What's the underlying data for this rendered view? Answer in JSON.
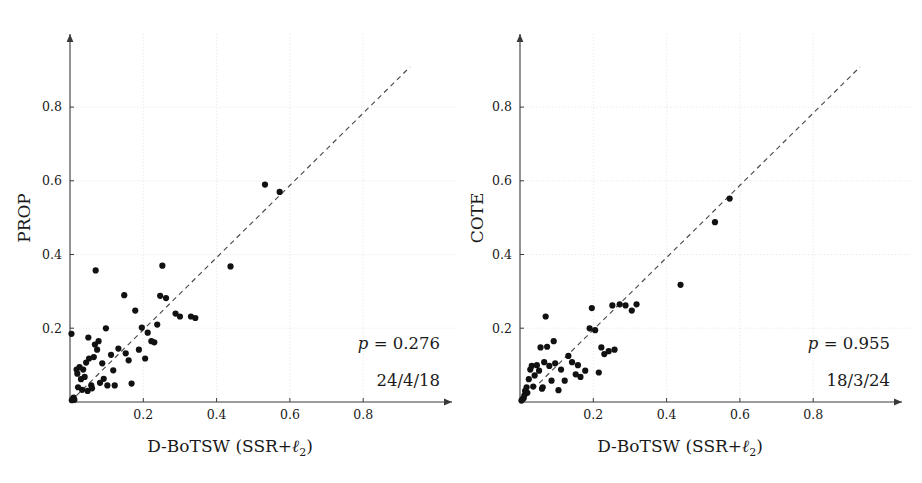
{
  "figure": {
    "width": 922,
    "height": 483,
    "background": "#ffffff",
    "dot_color": "#111111",
    "axis_color": "#3a3a3a",
    "grid_color": "#d8d8d8",
    "diagonal_color": "#4a4a4a"
  },
  "panels": [
    {
      "id": "left",
      "ylabel": "PROP",
      "xlabel_main": "D-BoTSW (SSR+",
      "xlabel_sym": "ℓ",
      "xlabel_sub": "2",
      "xlabel_close": ")",
      "xlabel_full": "D-BoTSW (SSR+ℓ2)",
      "p_label": "p",
      "p_eq": " = ",
      "p_value": "0.276",
      "p_text": "p = 0.276",
      "win_tie_loss": "24/4/18",
      "xticks": [
        "0.2",
        "0.4",
        "0.6",
        "0.8"
      ],
      "yticks": [
        "0.2",
        "0.4",
        "0.6",
        "0.8"
      ]
    },
    {
      "id": "right",
      "ylabel": "COTE",
      "xlabel_main": "D-BoTSW (SSR+",
      "xlabel_sym": "ℓ",
      "xlabel_sub": "2",
      "xlabel_close": ")",
      "xlabel_full": "D-BoTSW (SSR+ℓ2)",
      "p_label": "p",
      "p_eq": " = ",
      "p_value": "0.955",
      "p_text": "p = 0.955",
      "win_tie_loss": "18/3/24",
      "xticks": [
        "0.2",
        "0.4",
        "0.6",
        "0.8"
      ],
      "yticks": [
        "0.2",
        "0.4",
        "0.6",
        "0.8"
      ]
    }
  ],
  "chart_data": [
    {
      "type": "scatter",
      "title": "",
      "xlabel": "D-BoTSW (SSR+ℓ2)",
      "ylabel": "PROP",
      "xlim": [
        0,
        1.0
      ],
      "ylim": [
        0,
        1.0
      ],
      "xticks": [
        0.2,
        0.4,
        0.6,
        0.8
      ],
      "yticks": [
        0.2,
        0.4,
        0.6,
        0.8
      ],
      "grid": true,
      "legend": "none",
      "annotations": [
        "p = 0.276",
        "24/4/18"
      ],
      "reference_line": {
        "type": "identity",
        "style": "dashed",
        "from": [
          0.0,
          0.0
        ],
        "to": [
          0.93,
          0.96
        ]
      },
      "points": [
        [
          0.005,
          0.005
        ],
        [
          0.008,
          0.008
        ],
        [
          0.01,
          0.012
        ],
        [
          0.012,
          0.006
        ],
        [
          0.004,
          0.185
        ],
        [
          0.018,
          0.088
        ],
        [
          0.02,
          0.077
        ],
        [
          0.022,
          0.04
        ],
        [
          0.026,
          0.095
        ],
        [
          0.03,
          0.062
        ],
        [
          0.033,
          0.033
        ],
        [
          0.036,
          0.088
        ],
        [
          0.04,
          0.068
        ],
        [
          0.044,
          0.107
        ],
        [
          0.048,
          0.03
        ],
        [
          0.05,
          0.175
        ],
        [
          0.052,
          0.118
        ],
        [
          0.058,
          0.045
        ],
        [
          0.06,
          0.037
        ],
        [
          0.065,
          0.122
        ],
        [
          0.068,
          0.156
        ],
        [
          0.07,
          0.357
        ],
        [
          0.074,
          0.142
        ],
        [
          0.078,
          0.165
        ],
        [
          0.082,
          0.052
        ],
        [
          0.088,
          0.105
        ],
        [
          0.092,
          0.063
        ],
        [
          0.098,
          0.2
        ],
        [
          0.102,
          0.045
        ],
        [
          0.112,
          0.128
        ],
        [
          0.118,
          0.086
        ],
        [
          0.122,
          0.045
        ],
        [
          0.132,
          0.145
        ],
        [
          0.148,
          0.29
        ],
        [
          0.152,
          0.132
        ],
        [
          0.16,
          0.113
        ],
        [
          0.168,
          0.05
        ],
        [
          0.178,
          0.248
        ],
        [
          0.188,
          0.142
        ],
        [
          0.196,
          0.202
        ],
        [
          0.205,
          0.118
        ],
        [
          0.212,
          0.188
        ],
        [
          0.222,
          0.165
        ],
        [
          0.23,
          0.162
        ],
        [
          0.238,
          0.21
        ],
        [
          0.246,
          0.288
        ],
        [
          0.252,
          0.37
        ],
        [
          0.262,
          0.282
        ],
        [
          0.288,
          0.24
        ],
        [
          0.3,
          0.232
        ],
        [
          0.33,
          0.232
        ],
        [
          0.342,
          0.228
        ],
        [
          0.438,
          0.368
        ],
        [
          0.532,
          0.59
        ],
        [
          0.572,
          0.57
        ]
      ]
    },
    {
      "type": "scatter",
      "title": "",
      "xlabel": "D-BoTSW (SSR+ℓ2)",
      "ylabel": "COTE",
      "xlim": [
        0,
        1.0
      ],
      "ylim": [
        0,
        1.0
      ],
      "xticks": [
        0.2,
        0.4,
        0.6,
        0.8
      ],
      "yticks": [
        0.2,
        0.4,
        0.6,
        0.8
      ],
      "grid": true,
      "legend": "none",
      "annotations": [
        "p = 0.955",
        "18/3/24"
      ],
      "reference_line": {
        "type": "identity",
        "style": "dashed",
        "from": [
          0.0,
          0.0
        ],
        "to": [
          0.93,
          0.96
        ]
      },
      "points": [
        [
          0.004,
          0.004
        ],
        [
          0.007,
          0.008
        ],
        [
          0.01,
          0.01
        ],
        [
          0.012,
          0.018
        ],
        [
          0.014,
          0.03
        ],
        [
          0.018,
          0.04
        ],
        [
          0.02,
          0.025
        ],
        [
          0.024,
          0.062
        ],
        [
          0.028,
          0.088
        ],
        [
          0.032,
          0.098
        ],
        [
          0.036,
          0.042
        ],
        [
          0.04,
          0.072
        ],
        [
          0.046,
          0.1
        ],
        [
          0.052,
          0.085
        ],
        [
          0.056,
          0.148
        ],
        [
          0.06,
          0.036
        ],
        [
          0.062,
          0.04
        ],
        [
          0.066,
          0.108
        ],
        [
          0.07,
          0.232
        ],
        [
          0.074,
          0.15
        ],
        [
          0.08,
          0.098
        ],
        [
          0.086,
          0.058
        ],
        [
          0.092,
          0.165
        ],
        [
          0.096,
          0.105
        ],
        [
          0.105,
          0.032
        ],
        [
          0.112,
          0.088
        ],
        [
          0.122,
          0.058
        ],
        [
          0.132,
          0.125
        ],
        [
          0.142,
          0.108
        ],
        [
          0.152,
          0.075
        ],
        [
          0.158,
          0.1
        ],
        [
          0.165,
          0.068
        ],
        [
          0.178,
          0.085
        ],
        [
          0.19,
          0.2
        ],
        [
          0.196,
          0.255
        ],
        [
          0.205,
          0.195
        ],
        [
          0.215,
          0.08
        ],
        [
          0.222,
          0.148
        ],
        [
          0.23,
          0.13
        ],
        [
          0.242,
          0.138
        ],
        [
          0.252,
          0.262
        ],
        [
          0.258,
          0.142
        ],
        [
          0.272,
          0.265
        ],
        [
          0.288,
          0.262
        ],
        [
          0.305,
          0.248
        ],
        [
          0.318,
          0.265
        ],
        [
          0.438,
          0.318
        ],
        [
          0.532,
          0.488
        ],
        [
          0.572,
          0.552
        ]
      ]
    }
  ]
}
